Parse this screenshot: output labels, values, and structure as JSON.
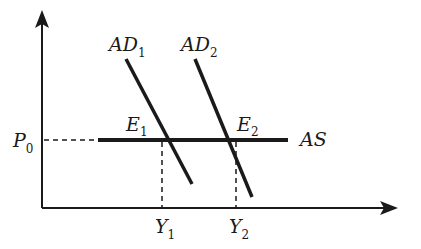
{
  "diagram": {
    "title": "",
    "type": "AD-AS model (horizontal aggregate supply)",
    "axes": {
      "y_axis_label": "",
      "x_axis_label": ""
    },
    "price_level": {
      "main": "P",
      "sub": "0"
    },
    "supply_curve": {
      "label": "AS"
    },
    "demand_curves": [
      {
        "main": "AD",
        "sub": "1"
      },
      {
        "main": "AD",
        "sub": "2"
      }
    ],
    "equilibria": [
      {
        "main": "E",
        "sub": "1"
      },
      {
        "main": "E",
        "sub": "2"
      }
    ],
    "outputs": [
      {
        "main": "Y",
        "sub": "1"
      },
      {
        "main": "Y",
        "sub": "2"
      }
    ],
    "colors": {
      "lines": "#1a1a1a",
      "background": "#ffffff"
    }
  }
}
